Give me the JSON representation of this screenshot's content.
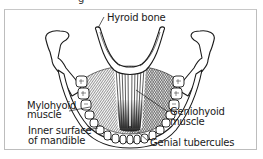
{
  "figure": {
    "cropped_caption_fragment": "g",
    "labels": {
      "hyroid_bone": "Hyroid bone",
      "mylohyoid_line1": "Mylohyoid",
      "mylohyoid_line2": "muscle",
      "geniohyoid_line1": "Geniohyoid",
      "geniohyoid_line2": "muscle",
      "inner_surface_line1": "Inner surface",
      "inner_surface_line2": "of mandible",
      "genial_tubercules": "Genial tubercules"
    },
    "colors": {
      "line": "#1a1a1a",
      "frame": "#bdbdbd",
      "background": "#ffffff"
    }
  }
}
